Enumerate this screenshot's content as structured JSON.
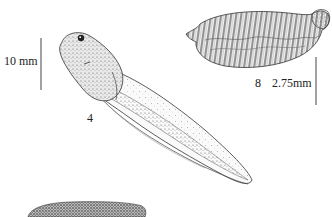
{
  "figure": {
    "scale_bars": [
      {
        "label": "10 mm",
        "position": "left"
      },
      {
        "label": "2.75mm",
        "position": "right"
      }
    ],
    "specimens": [
      {
        "number": "4",
        "description": "tadpole, lateral view"
      },
      {
        "number": "8",
        "description": "ridged larva / egg mass"
      },
      {
        "number": "",
        "description": "partially visible dark textured specimen at bottom"
      }
    ],
    "colors": {
      "ink": "#222222",
      "stipple": "#555555",
      "background": "#ffffff"
    }
  }
}
